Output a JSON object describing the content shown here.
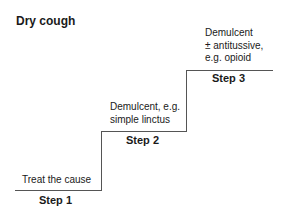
{
  "title": "Dry cough",
  "steps": [
    {
      "label": "Step 1",
      "text_lines": [
        "Treat the cause"
      ]
    },
    {
      "label": "Step 2",
      "text_lines": [
        "Demulcent, e.g.",
        "simple linctus"
      ]
    },
    {
      "label": "Step 3",
      "text_lines": [
        "Demulcent",
        "± antitussive,",
        "e.g. opioid"
      ]
    }
  ]
}
